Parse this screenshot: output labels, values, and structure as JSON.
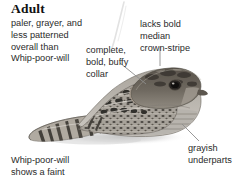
{
  "figure": {
    "heading": "Adult",
    "notes": {
      "left": "paler, grayer, and\nless patterned\noverall than\nWhip-poor-will",
      "collar": "complete,\nbold, buffy\ncollar",
      "crown": "lacks bold\nmedian\ncrown-stripe",
      "underparts": "grayish\nunderparts",
      "bottom_cut": "Whip-poor-will\nshows a faint"
    },
    "colors": {
      "text": "#2a2a2a",
      "heading": "#111111",
      "leader_line": "#8d8d8d",
      "page_background": "#ffffff",
      "plumage_dark": "#3f3c38",
      "plumage_mid": "#8b8782",
      "plumage_light": "#c9c5bf",
      "collar_buff": "#b8ada0",
      "shadow": "#c2c2c2"
    }
  }
}
